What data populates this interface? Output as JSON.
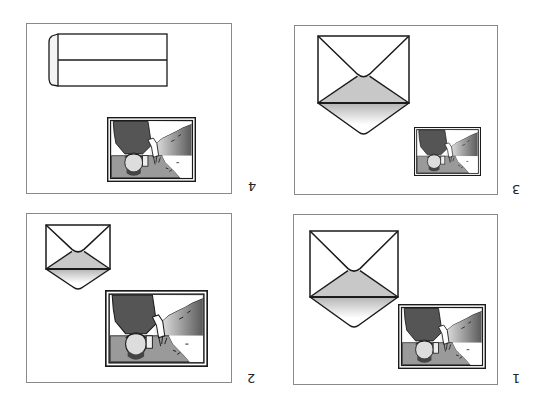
{
  "figure": {
    "orientation": "rotated-180",
    "colors": {
      "panel_border": "#8a8a8a",
      "line": "#1a1a1a",
      "flap_fill": "#c8c8c8",
      "photo_dark": "#555555",
      "photo_mid": "#9a9a9a"
    },
    "steps": [
      {
        "id": 1,
        "label": "1",
        "description": "Open envelope with flap lifted; photo placed next to it",
        "panel": {
          "x": 293,
          "y": 214,
          "w": 205,
          "h": 171
        },
        "label_pos": {
          "x": 512,
          "y": 372
        },
        "envelope": {
          "type": "open",
          "x": 310,
          "y": 231,
          "w": 88,
          "h": 66,
          "flap_tip": 30
        },
        "photo": {
          "x": 398,
          "y": 304,
          "w": 88,
          "h": 65
        }
      },
      {
        "id": 2,
        "label": "2",
        "description": "Smaller open envelope; larger photo",
        "panel": {
          "x": 26,
          "y": 213,
          "w": 206,
          "h": 170
        },
        "label_pos": {
          "x": 247,
          "y": 372
        },
        "envelope": {
          "type": "open",
          "x": 46,
          "y": 225,
          "w": 64,
          "h": 44,
          "flap_tip": 20
        },
        "photo": {
          "x": 105,
          "y": 290,
          "w": 103,
          "h": 77
        }
      },
      {
        "id": 3,
        "label": "3",
        "description": "Large open envelope; small photo",
        "panel": {
          "x": 294,
          "y": 25,
          "w": 204,
          "h": 170
        },
        "label_pos": {
          "x": 512,
          "y": 183
        },
        "envelope": {
          "type": "open",
          "x": 318,
          "y": 36,
          "w": 91,
          "h": 67,
          "flap_tip": 31
        },
        "photo": {
          "x": 414,
          "y": 127,
          "w": 67,
          "h": 49
        }
      },
      {
        "id": 4,
        "label": "4",
        "description": "Long sealed envelope (side view); photo",
        "panel": {
          "x": 26,
          "y": 23,
          "w": 206,
          "h": 171
        },
        "label_pos": {
          "x": 248,
          "y": 180
        },
        "envelope": {
          "type": "long",
          "x": 49,
          "y": 34,
          "w": 118,
          "h": 52,
          "flap_w": 9
        },
        "photo": {
          "x": 107,
          "y": 117,
          "w": 89,
          "h": 65
        }
      }
    ]
  }
}
